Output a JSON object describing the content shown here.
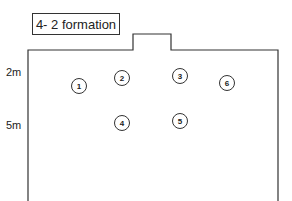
{
  "title": "4- 2 formation",
  "distances": [
    {
      "label": "2m",
      "x": 6,
      "y": 66
    },
    {
      "label": "5m",
      "x": 6,
      "y": 119
    }
  ],
  "players": [
    {
      "number": "1",
      "cx": 79,
      "cy": 86
    },
    {
      "number": "2",
      "cx": 122,
      "cy": 78
    },
    {
      "number": "3",
      "cx": 180,
      "cy": 76
    },
    {
      "number": "6",
      "cx": 227,
      "cy": 83
    },
    {
      "number": "4",
      "cx": 122,
      "cy": 123
    },
    {
      "number": "5",
      "cx": 180,
      "cy": 121
    }
  ],
  "colors": {
    "line": "#333333",
    "background": "#ffffff"
  }
}
